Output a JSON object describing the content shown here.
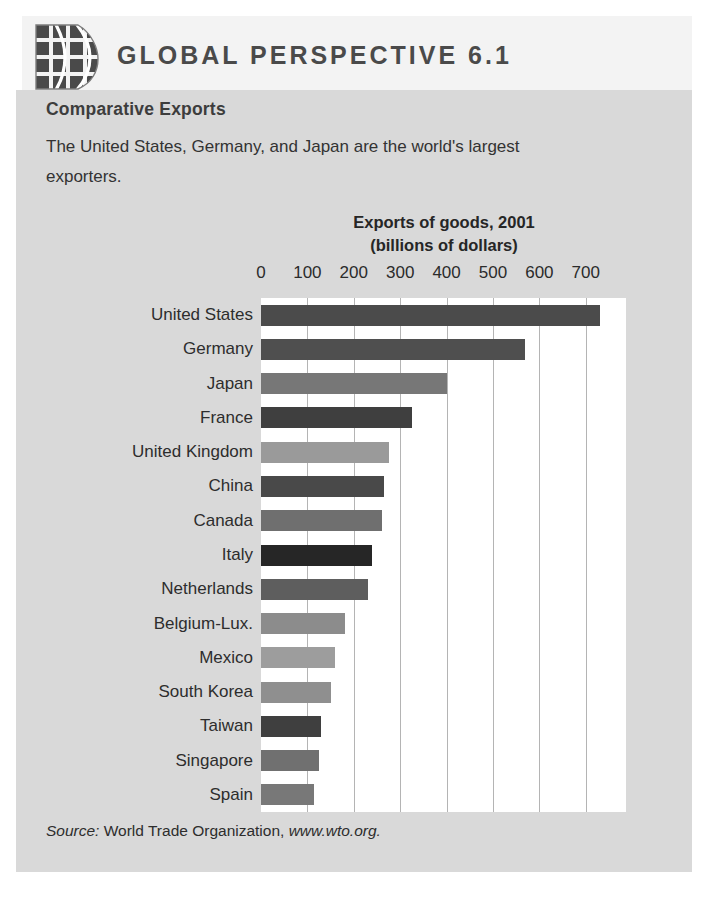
{
  "header": {
    "title": "GLOBAL PERSPECTIVE 6.1",
    "icon": "globe-grid-icon"
  },
  "body": {
    "subtitle": "Comparative Exports",
    "paragraph_line1": "The United States, Germany, and Japan are the world's largest",
    "paragraph_line2": "exporters."
  },
  "source": {
    "prefix": "Source:",
    "text": " World Trade Organization, ",
    "url": "www.wto.org."
  },
  "chart_data": {
    "type": "bar",
    "orientation": "horizontal",
    "title": "Exports of goods, 2001",
    "subtitle": "(billions of dollars)",
    "xlabel": "",
    "ylabel": "",
    "xlim": [
      0,
      780
    ],
    "grid": true,
    "legend": false,
    "tick_labels": [
      "0",
      "100",
      "200",
      "300",
      "400",
      "500",
      "600",
      "700"
    ],
    "tick_values": [
      0,
      100,
      200,
      300,
      400,
      500,
      600,
      700
    ],
    "categories": [
      "United States",
      "Germany",
      "Japan",
      "France",
      "United Kingdom",
      "China",
      "Canada",
      "Italy",
      "Netherlands",
      "Belgium-Lux.",
      "Mexico",
      "South Korea",
      "Taiwan",
      "Singapore",
      "Spain"
    ],
    "values": [
      730,
      570,
      400,
      325,
      275,
      265,
      260,
      240,
      230,
      180,
      160,
      150,
      130,
      125,
      115
    ],
    "bar_colors": [
      "#4b4b4b",
      "#4f4f4f",
      "#777777",
      "#3f3f3f",
      "#9a9a9a",
      "#494949",
      "#6f6f6f",
      "#262626",
      "#5e5e5e",
      "#8c8c8c",
      "#9d9d9d",
      "#8f8f8f",
      "#3f3f3f",
      "#707070",
      "#787878"
    ]
  },
  "colors": {
    "panel_background": "#d9d9d9",
    "header_background": "#f3f3f3",
    "plot_background": "#ffffff",
    "gridline": "#b4b4b4",
    "text": "#2d2d2d"
  }
}
